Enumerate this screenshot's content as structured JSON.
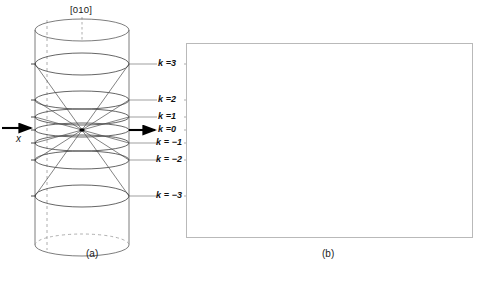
{
  "figure": {
    "panel_a": {
      "caption": "(a)",
      "direction_label": "[010]",
      "axis_label": "x",
      "zone_labels": [
        {
          "text": "k =3",
          "k": 3,
          "y": 64,
          "arrow": false
        },
        {
          "text": "k =2",
          "k": 2,
          "y": 100,
          "arrow": false
        },
        {
          "text": "k =1",
          "k": 1,
          "y": 117,
          "arrow": false
        },
        {
          "text": "k =0",
          "k": 0,
          "y": 130,
          "arrow": true
        },
        {
          "text": "k = −1",
          "k": -1,
          "y": 143,
          "arrow": false
        },
        {
          "text": "k = −2",
          "k": -2,
          "y": 160,
          "arrow": false
        },
        {
          "text": "k = −3",
          "k": -3,
          "y": 196,
          "arrow": false
        }
      ],
      "cylinder": {
        "cx": 82,
        "top_y": 30,
        "bottom_y": 245,
        "rx": 47,
        "ry": 11
      },
      "rings": [
        {
          "k": 3,
          "cy": 64,
          "rx": 47,
          "ry": 11
        },
        {
          "k": 2,
          "cy": 100,
          "rx": 47,
          "ry": 9
        },
        {
          "k": 1,
          "cy": 117,
          "rx": 47,
          "ry": 8
        },
        {
          "k": 0,
          "cy": 130,
          "rx": 47,
          "ry": 7
        },
        {
          "k": -1,
          "cy": 143,
          "rx": 47,
          "ry": 8
        },
        {
          "k": -2,
          "cy": 160,
          "rx": 47,
          "ry": 9
        },
        {
          "k": -3,
          "cy": 196,
          "rx": 47,
          "ry": 11
        }
      ],
      "apex": {
        "x": 82,
        "y": 130
      }
    },
    "panel_b": {
      "caption": "(b)",
      "frame": {
        "x": 186,
        "y": 43,
        "width": 287,
        "height": 195
      },
      "direct_beam": {
        "x": 142,
        "y": 90,
        "r": 4
      }
    }
  },
  "chart_data": {
    "type": "scatter",
    "xlabel": "",
    "ylabel": "",
    "grid": false,
    "legend_position": "none",
    "zone_rows": [
      {
        "k": 3,
        "y": 27,
        "style": "streak",
        "x": [
          22,
          28,
          47,
          52,
          66,
          72,
          76,
          97,
          101,
          158,
          159,
          186,
          214,
          243,
          249,
          252
        ]
      },
      {
        "k": 2,
        "y": 60,
        "style": "dot",
        "x": [
          4,
          28,
          31,
          42,
          52,
          57,
          62,
          66,
          70,
          82,
          86,
          98,
          126,
          141,
          148,
          158,
          165,
          171,
          175,
          181,
          190,
          201,
          206,
          237,
          243,
          281
        ]
      },
      {
        "k": 1,
        "y": 77,
        "style": "dot",
        "x": [
          28,
          36,
          43,
          49,
          55,
          82,
          86,
          97,
          103,
          118,
          167,
          174,
          182,
          190,
          223,
          231,
          237,
          249
        ]
      },
      {
        "k": 0,
        "y": 90,
        "style": "dot",
        "x": [
          17,
          31,
          42,
          47,
          52,
          57,
          69,
          74,
          85,
          90,
          97,
          103,
          108,
          167,
          175,
          182,
          190,
          198,
          206,
          214,
          218,
          222,
          236,
          243,
          249
        ]
      },
      {
        "k": -1,
        "y": 104,
        "style": "dot",
        "x": [
          10,
          27,
          39,
          45,
          51,
          57,
          98,
          118,
          166,
          175,
          183,
          191,
          221,
          227,
          237,
          251
        ]
      },
      {
        "k": -2,
        "y": 120,
        "style": "dot",
        "x": [
          9,
          27,
          31,
          44,
          52,
          58,
          63,
          67,
          77,
          81,
          97,
          139,
          151,
          159,
          166,
          172,
          177,
          183,
          189,
          197,
          205,
          210,
          237,
          272
        ]
      },
      {
        "k": -3,
        "y": 155,
        "style": "streak",
        "x": [
          26,
          30,
          51,
          54,
          74,
          77,
          167,
          170,
          201,
          204,
          224,
          227,
          234,
          237
        ]
      }
    ]
  }
}
